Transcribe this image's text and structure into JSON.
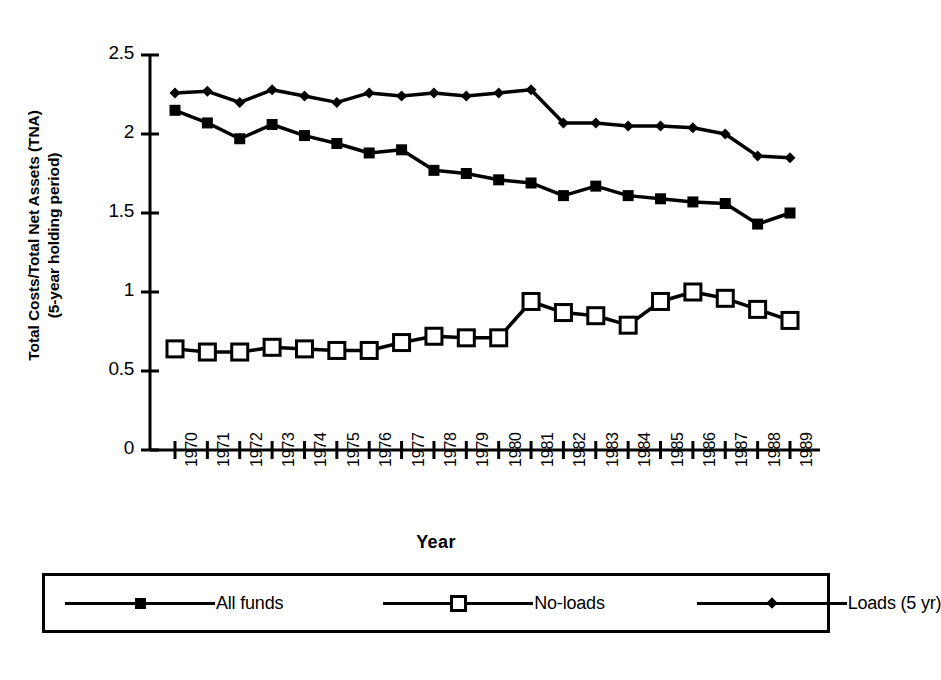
{
  "chart_data": {
    "type": "line",
    "title": "",
    "xlabel": "Year",
    "ylabel": "Total Costs/Total Net Assets (TNA)",
    "ylabel_line2": "(5-year holding period)",
    "ylabel_lines": [
      "Total Costs/Total Net Assets (TNA)",
      "(5-year holding period)"
    ],
    "categories": [
      "1970",
      "1971",
      "1972",
      "1973",
      "1974",
      "1975",
      "1976",
      "1977",
      "1978",
      "1979",
      "1980",
      "1981",
      "1982",
      "1983",
      "1984",
      "1985",
      "1986",
      "1987",
      "1988",
      "1989"
    ],
    "x": [
      1970,
      1971,
      1972,
      1973,
      1974,
      1975,
      1976,
      1977,
      1978,
      1979,
      1980,
      1981,
      1982,
      1983,
      1984,
      1985,
      1986,
      1987,
      1988,
      1989
    ],
    "ylim": [
      0,
      2.5
    ],
    "yticks": [
      0,
      0.5,
      1,
      1.5,
      2,
      2.5
    ],
    "ytick_labels": [
      "0",
      "0.5",
      "1",
      "1.5",
      "2",
      "2.5"
    ],
    "grid": false,
    "legend_position": "bottom",
    "series": [
      {
        "name": "All funds",
        "marker": "filled-square",
        "values": [
          2.15,
          2.07,
          1.97,
          2.06,
          1.99,
          1.94,
          1.88,
          1.9,
          1.77,
          1.75,
          1.71,
          1.69,
          1.61,
          1.67,
          1.61,
          1.59,
          1.57,
          1.56,
          1.43,
          1.5
        ]
      },
      {
        "name": "No-loads",
        "marker": "open-square",
        "values": [
          0.64,
          0.62,
          0.62,
          0.65,
          0.64,
          0.63,
          0.63,
          0.68,
          0.72,
          0.71,
          0.71,
          0.94,
          0.87,
          0.85,
          0.79,
          0.94,
          1.0,
          0.96,
          0.89,
          0.82
        ]
      },
      {
        "name": "Loads (5 yr)",
        "marker": "filled-diamond",
        "values": [
          2.26,
          2.27,
          2.2,
          2.28,
          2.24,
          2.2,
          2.26,
          2.24,
          2.26,
          2.24,
          2.26,
          2.28,
          2.07,
          2.07,
          2.05,
          2.05,
          2.04,
          2.0,
          1.86,
          1.85
        ]
      }
    ]
  },
  "legend": {
    "entries": [
      {
        "label": "All funds",
        "marker": "filled-square"
      },
      {
        "label": "No-loads",
        "marker": "open-square"
      },
      {
        "label": "Loads (5 yr)",
        "marker": "filled-diamond"
      }
    ]
  },
  "colors": {
    "ink": "#000000",
    "background": "#ffffff"
  }
}
